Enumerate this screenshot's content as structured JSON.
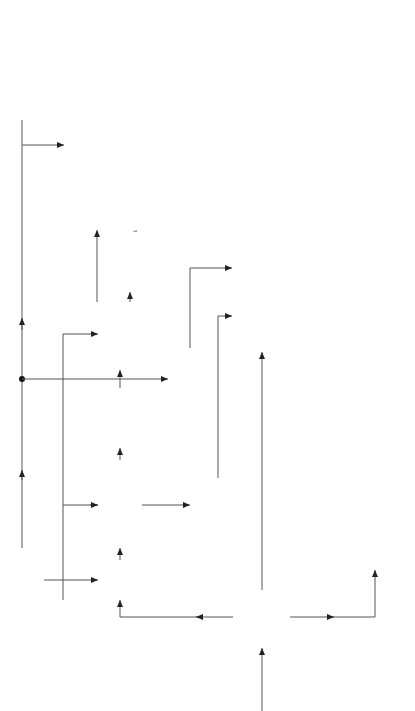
{
  "diagram": {
    "type": "block-diagram",
    "orientation": "rotated 90deg counterclockwise",
    "blocks": {
      "line_timebase": [
        "Line",
        "timebase"
      ],
      "burst_gate_amp": [
        "Burst",
        "gate",
        "amp."
      ],
      "phase_discriminator": [
        "Phase",
        "discriminator"
      ],
      "reactance_stage": [
        "Reactance",
        "stage"
      ],
      "reference_oscillator": [
        "Reference",
        "oscillator"
      ],
      "phase_change_90": [
        "90°",
        "phase",
        "change"
      ],
      "pal_switch": [
        "Pal",
        "switch",
        "180°"
      ],
      "ident_amp": [
        "7.8 kHz",
        "ident",
        "amp."
      ],
      "burst_blanking": [
        "Burst",
        "blanking"
      ],
      "video_amp": [
        "Video",
        "amp."
      ],
      "colour_decoder": [
        "Colour decoder",
        "and amplifier"
      ],
      "comb_filter": [
        "Comb filter"
      ],
      "matrix": [
        "M",
        "A",
        "T",
        "R",
        "I",
        "X"
      ],
      "r_drive": [
        "R",
        "drive"
      ],
      "g_drive": [
        "G",
        "drive"
      ],
      "b_drive": [
        "B",
        "drive"
      ],
      "luminance_amp": [
        "Luminance",
        "amp."
      ],
      "luminance_delay": [
        "Luminance",
        "delay"
      ],
      "subcarrier_notch": [
        "Subcarrier",
        "notch",
        "filter"
      ],
      "luminance_output_amp": [
        "Luminance",
        "outout",
        "amp"
      ]
    },
    "labels": {
      "burst_processing": [
        "Burst",
        "processing"
      ],
      "composite_input": [
        "Composite",
        "colour",
        "signal",
        "from vision",
        "detector"
      ],
      "luminance_processing": [
        "Luminance",
        "processing"
      ],
      "colour_kill": "Colour kill",
      "v_subcarrier": [
        "∓ V",
        "subcarrier"
      ],
      "u_subcarrier": [
        "U",
        "subcarrier"
      ],
      "r_minus_y": "R' -Y'",
      "b_minus_y": "B' -Y'",
      "y": "Y",
      "out_r": "R",
      "out_g": "G",
      "out_b": "B"
    }
  }
}
